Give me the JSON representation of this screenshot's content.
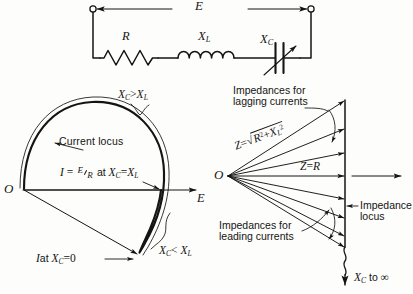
{
  "figure": {
    "title_implied": "Series R-L-C circuit with variable capacitor, current locus and impedance locus diagrams",
    "ink_color": "#141414",
    "paper_color": "#fdfdfb"
  },
  "circuit": {
    "source_label": "E",
    "resistor_label": "R",
    "inductor_label": "X",
    "inductor_sub": "L",
    "capacitor_label": "X",
    "capacitor_sub": "C",
    "terminal_left": "terminal-circle-left",
    "terminal_right": "terminal-circle-right"
  },
  "current_locus": {
    "origin_label": "O",
    "axis_label": "E",
    "locus_name": "Current locus",
    "top_condition": {
      "x": "X",
      "x_sub": "C",
      "rel": ">",
      "y": "X",
      "y_sub": "L"
    },
    "bottom_condition": {
      "x": "X",
      "x_sub": "C",
      "rel": "<",
      "y": "X",
      "y_sub": "L"
    },
    "resonance_note": {
      "i": "I",
      "eq": "=",
      "num": "E",
      "den": "R",
      "at": "at",
      "x": "X",
      "x_sub": "C",
      "rel": "=",
      "y": "X",
      "y_sub": "L"
    },
    "zero_point_note": {
      "i": "I",
      "at": "at",
      "x": "X",
      "x_sub": "C",
      "rel": "=",
      "value": "0"
    }
  },
  "impedance_locus": {
    "origin_label": "O",
    "lagging_note_line1": "Impedances for",
    "lagging_note_line2": "lagging currents",
    "leading_note_line1": "Impedances for",
    "leading_note_line2": "leading currents",
    "locus_note_line1": "Impedance",
    "locus_note_line2": "locus",
    "z_formula": {
      "z": "Z",
      "eq": "=",
      "radical": "√",
      "r": "R",
      "r_exp": "2",
      "plus": "+",
      "x": "X",
      "x_sub": "L",
      "x_exp": "2"
    },
    "z_equals_r": {
      "z": "Z",
      "eq": "=",
      "r": "R"
    },
    "infinity_note": {
      "x": "X",
      "x_sub": "C",
      "text": "to",
      "symbol": "∞"
    }
  }
}
